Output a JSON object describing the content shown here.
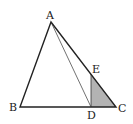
{
  "figure": {
    "type": "geometry-triangle",
    "points": {
      "A": {
        "label": "A",
        "x": 51,
        "y": 22
      },
      "B": {
        "label": "B",
        "x": 20,
        "y": 107
      },
      "C": {
        "label": "C",
        "x": 116,
        "y": 107
      },
      "D": {
        "label": "D",
        "x": 91,
        "y": 107
      },
      "E": {
        "label": "E",
        "x": 91,
        "y": 74
      }
    },
    "segments": [
      "AB",
      "BC",
      "CA",
      "AD",
      "DE"
    ],
    "shaded_region": "EDC",
    "shade_color": "#b3b3b3",
    "line_color": "#222222"
  }
}
